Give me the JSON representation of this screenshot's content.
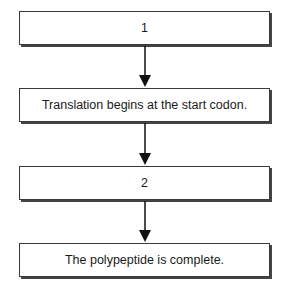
{
  "diagram": {
    "type": "flowchart",
    "direction": "top-to-bottom",
    "steps": [
      {
        "id": "step1",
        "label": "1"
      },
      {
        "id": "step2",
        "label": "Translation begins at the start codon."
      },
      {
        "id": "step3",
        "label": "2"
      },
      {
        "id": "step4",
        "label": "The polypeptide is complete."
      }
    ],
    "edges": [
      {
        "from": "step1",
        "to": "step2"
      },
      {
        "from": "step2",
        "to": "step3"
      },
      {
        "from": "step3",
        "to": "step4"
      }
    ],
    "colors": {
      "border": "#3a3a3a",
      "shadow": "#444444",
      "arrow": "#111111",
      "background": "#ffffff"
    }
  }
}
